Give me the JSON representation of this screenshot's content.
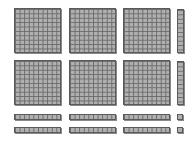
{
  "diagram": {
    "type": "base-ten-blocks",
    "colors": {
      "fill": "#b0b0b0",
      "grid": "#6a6a6a",
      "border": "#5a5a5a"
    },
    "counts": {
      "hundreds": 6,
      "tens": 8,
      "ones": 2
    },
    "flats": [
      {
        "x": 14,
        "y": 8,
        "w": 47,
        "h": 45
      },
      {
        "x": 69,
        "y": 8,
        "w": 47,
        "h": 45
      },
      {
        "x": 123,
        "y": 8,
        "w": 47,
        "h": 45
      },
      {
        "x": 14,
        "y": 60,
        "w": 47,
        "h": 45
      },
      {
        "x": 69,
        "y": 60,
        "w": 47,
        "h": 45
      },
      {
        "x": 123,
        "y": 60,
        "w": 47,
        "h": 45
      }
    ],
    "vertical_rods": [
      {
        "x": 177,
        "y": 9,
        "w": 7,
        "h": 44
      },
      {
        "x": 177,
        "y": 61,
        "w": 7,
        "h": 44
      }
    ],
    "horizontal_rods": [
      {
        "x": 14,
        "y": 114,
        "w": 47,
        "h": 6
      },
      {
        "x": 69,
        "y": 114,
        "w": 47,
        "h": 6
      },
      {
        "x": 123,
        "y": 114,
        "w": 47,
        "h": 6
      },
      {
        "x": 14,
        "y": 127,
        "w": 47,
        "h": 6
      },
      {
        "x": 69,
        "y": 127,
        "w": 47,
        "h": 6
      },
      {
        "x": 123,
        "y": 127,
        "w": 47,
        "h": 6
      }
    ],
    "units": [
      {
        "x": 177,
        "y": 114,
        "w": 6,
        "h": 6
      },
      {
        "x": 177,
        "y": 127,
        "w": 6,
        "h": 6
      }
    ]
  }
}
